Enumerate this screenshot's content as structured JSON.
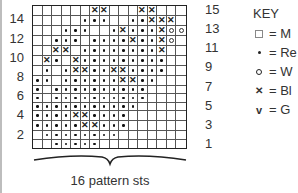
{
  "chart": {
    "columns": 16,
    "rows": 15,
    "left_row_labels": [
      "14",
      "12",
      "10",
      "8",
      "6",
      "4",
      "2"
    ],
    "right_row_labels": [
      "15",
      "13",
      "11",
      "9",
      "7",
      "5",
      "3",
      "1"
    ],
    "caption": "16 pattern sts",
    "grid_top_to_bottom": [
      "......xx...xx.",
      ".....•••..••xxx.",
      "...•••..•x•••xoo",
      "..•••.••••x••xo.",
      "..xx.••••••••x..",
      ".x•.x•••••••••..",
      ".•.•xx••xx••••..",
      "••.••••••xx••...",
      "•.••••••••••....",
      "•.••••••••••....",
      "•••••••••••.....",
      "••••xx••••......",
      "•••••xx•••......",
      ".••••••••.......",
      "..•••••........."
    ]
  },
  "key": {
    "title": "KEY",
    "items": [
      {
        "symbol": "box",
        "label": "= M"
      },
      {
        "symbol": "dot",
        "label": "= Re"
      },
      {
        "symbol": "o",
        "label": "= W"
      },
      {
        "symbol": "x",
        "label": "= Bl"
      },
      {
        "symbol": "v",
        "label": "= G"
      }
    ]
  }
}
